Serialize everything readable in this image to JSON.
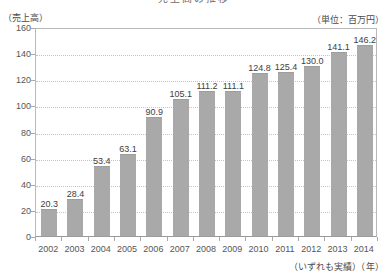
{
  "chart_data": {
    "type": "bar",
    "title": "売上高の推移",
    "subtitle": "",
    "xlabel": "（年）",
    "ylabel": "（売上高）",
    "unit_note": "（単位：百万円）",
    "footnote": "（いずれも実績）（年）",
    "categories": [
      "2002",
      "2003",
      "2004",
      "2005",
      "2006",
      "2007",
      "2008",
      "2009",
      "2010",
      "2011",
      "2012",
      "2013",
      "2014"
    ],
    "values": [
      20.3,
      28.4,
      53.4,
      63.1,
      90.9,
      105.1,
      111.2,
      111.1,
      124.8,
      125.4,
      130.0,
      141.1,
      146.2
    ],
    "value_labels": [
      "20.3",
      "28.4",
      "53.4",
      "63.1",
      "90.9",
      "105.1",
      "111.2",
      "111.1",
      "124.8",
      "125.4",
      "130.0",
      "141.1",
      "146.2"
    ],
    "ylim": [
      0,
      160
    ],
    "ytick_labels": [
      "160",
      "140",
      "120",
      "100",
      "80",
      "60",
      "40",
      "20",
      "0"
    ],
    "ytick_values": [
      160,
      140,
      120,
      100,
      80,
      60,
      40,
      20,
      0
    ],
    "grid": true,
    "grid_style": "dotted-horizontal",
    "legend": "none",
    "bar_color": "#a9a9a9",
    "axis_color": "#b9b9b9",
    "grid_color": "#c4c4c4",
    "text_color": "#444444"
  }
}
